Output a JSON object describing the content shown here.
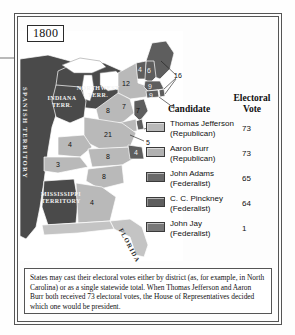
{
  "year_label": "1800",
  "map": {
    "territories": [
      {
        "name": "SPANISH TERRITORY"
      },
      {
        "name": "NORTHWEST TERR."
      },
      {
        "name": "INDIANA TERR."
      },
      {
        "name": "MISSISSIPPI TERRITORY"
      },
      {
        "name": "FLORIDA"
      }
    ],
    "state_votes": [
      {
        "state": "Maine (Massachusetts)",
        "value": "16"
      },
      {
        "state": "New Hampshire",
        "value": "6"
      },
      {
        "state": "Vermont",
        "value": "4"
      },
      {
        "state": "New York",
        "value": "12"
      },
      {
        "state": "Massachusetts",
        "value": "9"
      },
      {
        "state": "Rhode Island",
        "value": "4"
      },
      {
        "state": "Connecticut",
        "value": "9"
      },
      {
        "state": "Pennsylvania",
        "value": "8"
      },
      {
        "state": "New Jersey",
        "value": "7"
      },
      {
        "state": "Delaware",
        "value": "3"
      },
      {
        "state": "Maryland",
        "value": "5"
      },
      {
        "state": "Virginia",
        "value": "21"
      },
      {
        "state": "Ohio region",
        "value": "8"
      },
      {
        "state": "Kentucky",
        "value": "4"
      },
      {
        "state": "Tennessee",
        "value": "3"
      },
      {
        "state": "North Carolina",
        "value": "8"
      },
      {
        "state": "North Carolina Federalist",
        "value": "4"
      },
      {
        "state": "South Carolina",
        "value": "8"
      },
      {
        "state": "Georgia",
        "value": "4"
      },
      {
        "state": "New York area",
        "value": "7"
      }
    ]
  },
  "legend": {
    "header_candidate": "Candidate",
    "header_vote_line1": "Electoral",
    "header_vote_line2": "Vote",
    "rows": [
      {
        "name": "Thomas Jefferson",
        "party": "(Republican)",
        "votes": "73",
        "color": "#b9b9b9"
      },
      {
        "name": "Aaron Burr",
        "party": "(Republican)",
        "votes": "73",
        "color": "#b1b1b1"
      },
      {
        "name": "John Adams",
        "party": "(Federalist)",
        "votes": "65",
        "color": "#696969"
      },
      {
        "name": "C. C. Pinckney",
        "party": "(Federalist)",
        "votes": "64",
        "color": "#5e5e5e"
      },
      {
        "name": "John Jay",
        "party": "(Federalist)",
        "votes": "1",
        "color": "#787878"
      }
    ]
  },
  "caption": "States may cast their electoral votes either by district (as, for example, in North Carolina) or as a single statewide total. When Thomas Jefferson and Aaron Burr both received 73 electoral votes, the House of Representatives decided which one would be president.",
  "colors": {
    "republican": "#b9b9b9",
    "federalist": "#5e5e5e",
    "territory": "#4a4a4a",
    "water": "#ffffff"
  }
}
